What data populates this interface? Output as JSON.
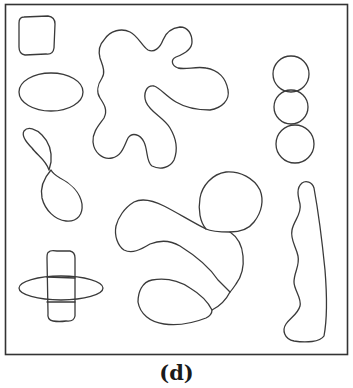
{
  "figure": {
    "caption": "(d)",
    "panel": "segmentation-contours",
    "shapes": [
      "rounded-square",
      "ellipse",
      "figure-eight",
      "cross",
      "star-blob",
      "triple-circle-chain",
      "circle-and-arms-cluster",
      "wavy-vertical-strip"
    ],
    "colors": {
      "background": "#ffffff",
      "stroke": "#3a3a3a",
      "frame": "#333333"
    }
  }
}
